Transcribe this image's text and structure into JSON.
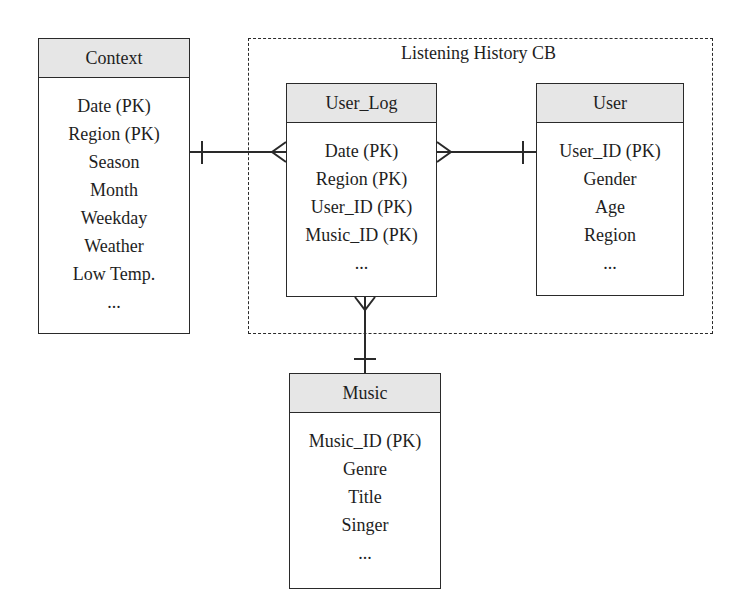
{
  "diagram": {
    "type": "entity-relationship",
    "group": {
      "label": "Listening History CB",
      "contains": [
        "User_Log",
        "User"
      ]
    },
    "entities": [
      {
        "id": "context",
        "title": "Context",
        "attributes": [
          "Date (PK)",
          "Region (PK)",
          "Season",
          "Month",
          "Weekday",
          "Weather",
          "Low Temp.",
          "..."
        ]
      },
      {
        "id": "user_log",
        "title": "User_Log",
        "attributes": [
          "Date (PK)",
          "Region (PK)",
          "User_ID (PK)",
          "Music_ID (PK)",
          "..."
        ]
      },
      {
        "id": "user",
        "title": "User",
        "attributes": [
          "User_ID (PK)",
          "Gender",
          "Age",
          "Region",
          "..."
        ]
      },
      {
        "id": "music",
        "title": "Music",
        "attributes": [
          "Music_ID (PK)",
          "Genre",
          "Title",
          "Singer",
          "..."
        ]
      }
    ],
    "relationships": [
      {
        "from": "Context",
        "from_cardinality": "one",
        "to": "User_Log",
        "to_cardinality": "many"
      },
      {
        "from": "User",
        "from_cardinality": "one",
        "to": "User_Log",
        "to_cardinality": "many"
      },
      {
        "from": "Music",
        "from_cardinality": "one",
        "to": "User_Log",
        "to_cardinality": "many"
      }
    ],
    "colors": {
      "header_fill": "#e6e6e6",
      "stroke": "#2a2a2a",
      "background": "#ffffff"
    }
  }
}
